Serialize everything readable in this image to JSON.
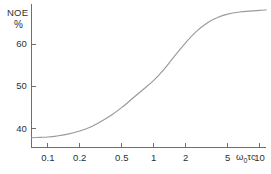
{
  "chart_data": {
    "type": "line",
    "title": "",
    "subtitle": "",
    "xlabel": "ω₀τc",
    "ylabel": "NOE",
    "ylabel_unit": "%",
    "xscale": "log",
    "yscale": "linear",
    "xlim": [
      0.07,
      11.5
    ],
    "ylim": [
      35.5,
      69.5
    ],
    "grid": false,
    "legend": false,
    "legend_position": "none",
    "x_tick_labels": [
      "0.1",
      "0.2",
      "0.5",
      "1",
      "2",
      "5",
      "10"
    ],
    "x_tick_values": [
      0.1,
      0.2,
      0.5,
      1,
      2,
      5,
      10
    ],
    "y_tick_labels": [
      "40",
      "50",
      "60"
    ],
    "y_tick_values": [
      40,
      50,
      60
    ],
    "series": [
      {
        "name": "NOE enhancement",
        "color": "#9a9a9a",
        "x": [
          0.07,
          0.085,
          0.1,
          0.12,
          0.15,
          0.2,
          0.25,
          0.3,
          0.4,
          0.5,
          0.65,
          0.8,
          1.0,
          1.25,
          1.6,
          2.0,
          2.5,
          3.2,
          4.0,
          5.0,
          6.5,
          8.0,
          10.0,
          11.5
        ],
        "y": [
          37.8,
          37.9,
          38.0,
          38.2,
          38.6,
          39.4,
          40.3,
          41.3,
          43.2,
          45.0,
          47.4,
          49.3,
          51.4,
          54.0,
          57.4,
          60.3,
          62.9,
          65.0,
          66.3,
          67.1,
          67.6,
          67.8,
          68.0,
          68.1
        ]
      }
    ]
  },
  "axis": {
    "y_title": "NOE",
    "y_unit": "%",
    "x_title_symbol": "ω",
    "x_title_sub": "0",
    "x_title_tail": "τc"
  },
  "colors": {
    "axis": "#6e6e6e",
    "curve": "#9a9a9a",
    "text": "#2f2f2f",
    "background": "#ffffff"
  }
}
